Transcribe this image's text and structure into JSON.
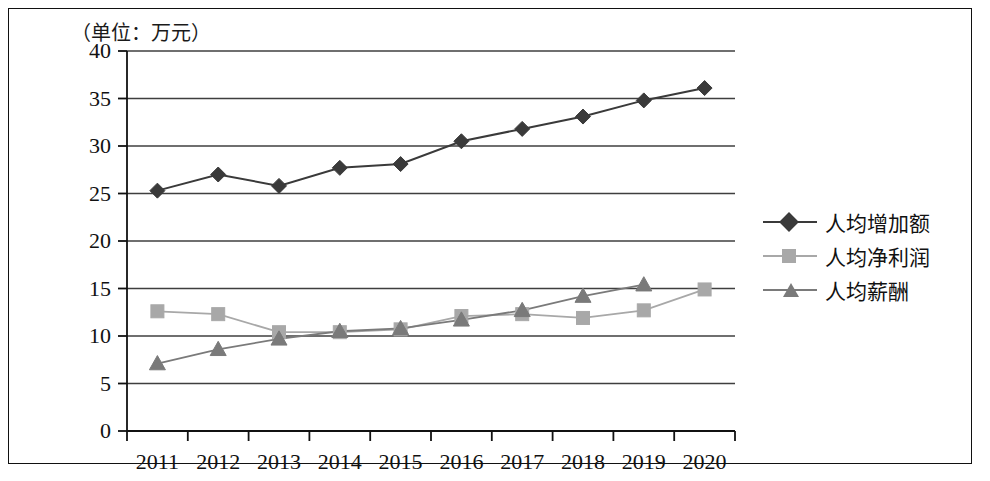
{
  "figure": {
    "unit_label": "（单位：万元）",
    "border_color": "#111111",
    "background": "#ffffff"
  },
  "chart_data": {
    "type": "line",
    "title": "",
    "subtitle": "",
    "unit_note": "（单位：万元）",
    "xlabel": "",
    "ylabel": "",
    "categories": [
      "2011",
      "2012",
      "2013",
      "2014",
      "2015",
      "2016",
      "2017",
      "2018",
      "2019",
      "2020"
    ],
    "ylim": [
      0,
      40
    ],
    "yticks": [
      0,
      5,
      10,
      15,
      20,
      25,
      30,
      35,
      40
    ],
    "ytick_labels": [
      "0",
      "5",
      "10",
      "15",
      "20",
      "25",
      "30",
      "35",
      "40"
    ],
    "grid": "horizontal",
    "legend_position": "right",
    "series": [
      {
        "name": "人均增加额",
        "marker": "diamond",
        "color": "#3a3a3a",
        "values": [
          25.3,
          27.0,
          25.8,
          27.7,
          28.1,
          30.5,
          31.8,
          33.1,
          34.8,
          36.1
        ]
      },
      {
        "name": "人均净利润",
        "marker": "square",
        "color": "#a8a8a8",
        "values": [
          12.6,
          12.3,
          10.4,
          10.4,
          10.7,
          12.1,
          12.3,
          11.9,
          12.7,
          14.9
        ]
      },
      {
        "name": "人均薪酬",
        "marker": "triangle",
        "color": "#7a7a7a",
        "values": [
          7.1,
          8.6,
          9.7,
          10.5,
          10.8,
          11.7,
          12.7,
          14.2,
          15.4,
          null
        ]
      }
    ]
  },
  "legend": {
    "items": [
      {
        "label": "人均增加额",
        "marker": "diamond",
        "color": "#3a3a3a"
      },
      {
        "label": "人均净利润",
        "marker": "square",
        "color": "#a8a8a8"
      },
      {
        "label": "人均薪酬",
        "marker": "triangle",
        "color": "#7a7a7a"
      }
    ]
  }
}
